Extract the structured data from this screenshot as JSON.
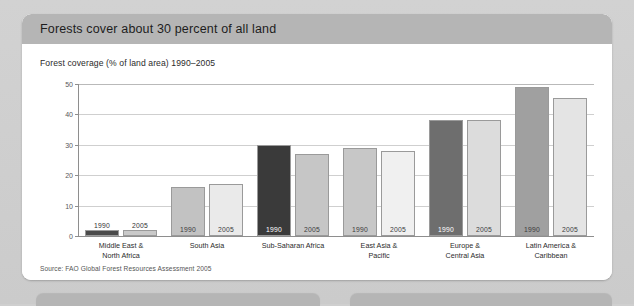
{
  "card": {
    "title": "Forests cover about 30 percent of all land",
    "source": "Source: FAO Global Forest Resources Assessment 2005"
  },
  "chart_data": {
    "type": "bar",
    "title": "Forests cover about 30 percent of all land",
    "subtitle": "Forest coverage (% of land area) 1990–2005",
    "xlabel": "",
    "ylabel": "",
    "ylim": [
      0,
      50
    ],
    "yticks": [
      0,
      10,
      20,
      30,
      40,
      50
    ],
    "grid": true,
    "legend": "none",
    "categories": [
      "Middle East &\nNorth Africa",
      "South Asia",
      "Sub-Saharan Africa",
      "East Asia &\nPacific",
      "Europe &\nCentral Asia",
      "Latin America &\nCaribbean"
    ],
    "series": [
      {
        "name": "1990",
        "values": [
          2,
          16,
          30,
          29,
          38,
          49
        ]
      },
      {
        "name": "2005",
        "values": [
          2,
          17,
          27,
          28,
          38,
          45.5
        ]
      }
    ],
    "bar_colors": {
      "middle_east_1990": "#4a4a4a",
      "middle_east_2005": "#c9c9c9",
      "south_asia_1990": "#c2c2c2",
      "south_asia_2005": "#eaeaea",
      "sub_saharan_1990": "#3a3a3a",
      "sub_saharan_2005": "#c6c6c6",
      "east_asia_1990": "#c7c7c7",
      "east_asia_2005": "#f0f0f0",
      "europe_1990": "#6e6e6e",
      "europe_2005": "#dcdcdc",
      "latin_1990": "#a0a0a0",
      "latin_2005": "#e4e4e4"
    }
  },
  "bars": [
    {
      "group": 0,
      "year": "1990",
      "value": 2,
      "color": "#4a4a4a",
      "label_pos": "above"
    },
    {
      "group": 0,
      "year": "2005",
      "value": 2,
      "color": "#c9c9c9",
      "label_pos": "above"
    },
    {
      "group": 1,
      "year": "1990",
      "value": 16,
      "color": "#c2c2c2",
      "label_pos": "inside-light"
    },
    {
      "group": 1,
      "year": "2005",
      "value": 17,
      "color": "#eaeaea",
      "label_pos": "inside-light"
    },
    {
      "group": 2,
      "year": "1990",
      "value": 30,
      "color": "#3a3a3a",
      "label_pos": "inside-dark"
    },
    {
      "group": 2,
      "year": "2005",
      "value": 27,
      "color": "#c6c6c6",
      "label_pos": "inside-light"
    },
    {
      "group": 3,
      "year": "1990",
      "value": 29,
      "color": "#c7c7c7",
      "label_pos": "inside-light"
    },
    {
      "group": 3,
      "year": "2005",
      "value": 28,
      "color": "#f0f0f0",
      "label_pos": "inside-light"
    },
    {
      "group": 4,
      "year": "1990",
      "value": 38,
      "color": "#6e6e6e",
      "label_pos": "inside-dark"
    },
    {
      "group": 4,
      "year": "2005",
      "value": 38,
      "color": "#dcdcdc",
      "label_pos": "inside-light"
    },
    {
      "group": 5,
      "year": "1990",
      "value": 49,
      "color": "#a0a0a0",
      "label_pos": "inside-light"
    },
    {
      "group": 5,
      "year": "2005",
      "value": 45.5,
      "color": "#e4e4e4",
      "label_pos": "inside-light"
    }
  ]
}
